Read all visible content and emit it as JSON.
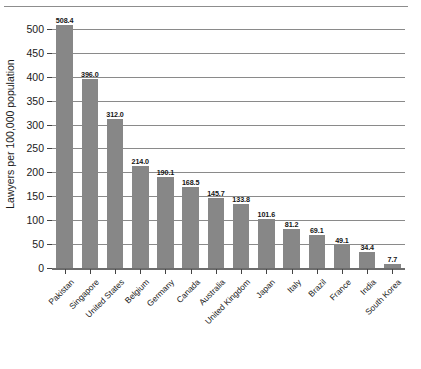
{
  "chart_data": {
    "type": "bar",
    "title": "",
    "subtitle": "",
    "xlabel": "",
    "ylabel": "Lawyers per 100,000 population",
    "ylim": [
      0,
      525
    ],
    "yticks": [
      0,
      50,
      100,
      150,
      200,
      250,
      300,
      350,
      400,
      450,
      500
    ],
    "ytick_labels": [
      "0",
      "50",
      "100",
      "150",
      "200",
      "250",
      "300",
      "350",
      "400",
      "450",
      "500"
    ],
    "grid": "horizontal",
    "legend": "none",
    "bar_color": "#878787",
    "value_labels": true,
    "categories": [
      "Pakistan",
      "Singapore",
      "United States",
      "Belgium",
      "Germany",
      "Canada",
      "Australia",
      "United Kingdom",
      "Japan",
      "Italy",
      "Brazil",
      "France",
      "India",
      "South Korea"
    ],
    "values": [
      508.4,
      396.0,
      312.0,
      214.0,
      190.1,
      168.5,
      145.7,
      133.8,
      101.6,
      81.2,
      69.1,
      49.1,
      34.4,
      7.7
    ],
    "value_label_texts": [
      "508.4",
      "396.0",
      "312.0",
      "214.0",
      "190.1",
      "168.5",
      "145.7",
      "133.8",
      "101.6",
      "81.2",
      "69.1",
      "49.1",
      "34.4",
      "7.7"
    ]
  }
}
